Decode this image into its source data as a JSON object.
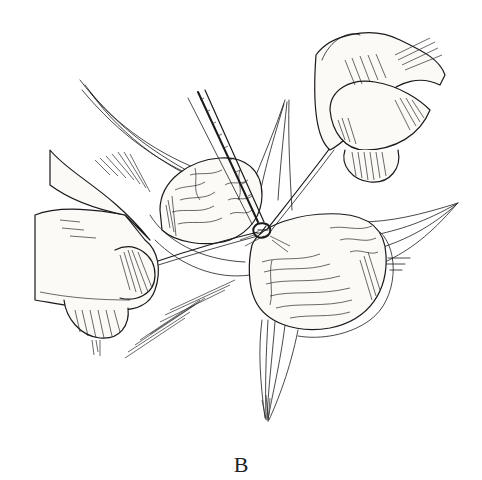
{
  "figure": {
    "label": "B",
    "elements": {
      "left_hand": "hand-holding-suture-left",
      "right_hand": "hand-holding-suture-right",
      "forceps": "forceps-instrument",
      "knot": "ligature-knot",
      "tissue_left": "tissue-mass-left",
      "tissue_right": "tissue-mass-right",
      "membranes": "fanned-membrane-tissue"
    },
    "colors": {
      "ink": "#1a1a1a",
      "paper": "#ffffff",
      "skin": "#fbfaf7"
    }
  }
}
